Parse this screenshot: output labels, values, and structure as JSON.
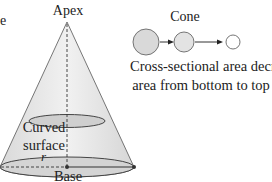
{
  "diagram": {
    "title": "Cone",
    "labels": {
      "apex": "Apex",
      "curved_surface": "Curved surface",
      "radius": "r",
      "base": "Base",
      "edge_fragment": "e"
    },
    "description": {
      "line1": "Cross-sectional area decreases in",
      "line2": "area from bottom to top"
    },
    "cross_sections": [
      {
        "name": "large",
        "relative_size": "large"
      },
      {
        "name": "medium",
        "relative_size": "medium"
      },
      {
        "name": "small",
        "relative_size": "small"
      }
    ],
    "colors": {
      "cone_fill": "#e6e6e6",
      "cone_fill_light": "#f2f2f2",
      "outline": "#444444",
      "circle_fill": "#dcdcdc",
      "small_circle_fill": "#ffffff",
      "text": "#222222"
    }
  }
}
